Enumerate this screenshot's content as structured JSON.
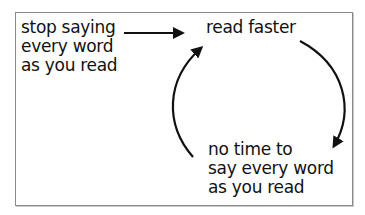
{
  "diagram": {
    "type": "cycle",
    "nodes": [
      {
        "id": "stop-saying",
        "lines": [
          "stop saying",
          "every word",
          "as you read"
        ]
      },
      {
        "id": "read-faster",
        "lines": [
          "read faster"
        ]
      },
      {
        "id": "no-time",
        "lines": [
          "no time to",
          "say every word",
          "as you read"
        ]
      }
    ],
    "edges": [
      {
        "from": "stop-saying",
        "to": "read-faster",
        "style": "straight"
      },
      {
        "from": "read-faster",
        "to": "no-time",
        "style": "curved"
      },
      {
        "from": "no-time",
        "to": "read-faster",
        "style": "curved"
      }
    ],
    "colors": {
      "stroke": "#111111",
      "border": "#8a8a8a",
      "background": "#ffffff"
    }
  }
}
